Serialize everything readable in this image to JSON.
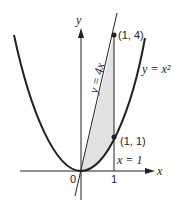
{
  "diagram": {
    "axes": {
      "x_label": "x",
      "y_label": "y",
      "origin_label": "0",
      "tick_x1": "1"
    },
    "curves": [
      {
        "name": "parabola",
        "label": "y = x²",
        "equation": "y = x^2"
      },
      {
        "name": "line",
        "label": "y = 4x",
        "equation": "y = 4x"
      },
      {
        "name": "vertical",
        "label": "x = 1",
        "equation": "x = 1"
      }
    ],
    "points": [
      {
        "label": "(1, 4)",
        "x": 1,
        "y": 4
      },
      {
        "label": "(1, 1)",
        "x": 1,
        "y": 1
      }
    ],
    "shaded_region": "between y = 4x and y = x² from x = 0 to x = 1",
    "colors": {
      "stroke": "#222222",
      "shade": "#e2e2e2"
    }
  }
}
